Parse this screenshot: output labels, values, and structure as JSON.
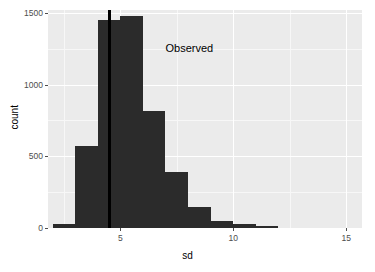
{
  "chart_data": {
    "type": "bar",
    "title": "",
    "subtitle": "",
    "xlabel": "sd",
    "ylabel": "count",
    "xlim": [
      1.8,
      15.7
    ],
    "ylim": [
      0,
      1520
    ],
    "grid": true,
    "legend": "none",
    "bin_width": 1,
    "categories": [
      "2.5",
      "3.5",
      "4.5",
      "5.5",
      "6.5",
      "7.5",
      "8.5",
      "9.5",
      "10.5",
      "11.5"
    ],
    "x": [
      2.5,
      3.5,
      4.5,
      5.5,
      6.5,
      7.5,
      8.5,
      9.5,
      10.5,
      11.5
    ],
    "values": [
      25,
      570,
      1450,
      1475,
      815,
      390,
      150,
      50,
      25,
      5
    ],
    "bar_color": "#2b2b2b",
    "panel_color": "#ebebeb",
    "gridline_color": "#ffffff",
    "xticks": [
      5,
      10,
      15
    ],
    "xtick_labels": [
      "5",
      "10",
      "15"
    ],
    "yticks": [
      0,
      500,
      1000,
      1500
    ],
    "ytick_labels": [
      "0",
      "500",
      "1000",
      "1500"
    ],
    "x_minor_ticks": [
      2.5,
      7.5,
      12.5
    ],
    "y_minor_ticks": [
      250,
      750,
      1250
    ],
    "annotations": [
      {
        "name": "observed-label",
        "text": "Observed",
        "x": 7.0,
        "y": 1290
      }
    ],
    "reference_lines": [
      {
        "name": "observed-vline",
        "orientation": "vertical",
        "x": 4.52,
        "color": "#000000",
        "width_px": 3
      }
    ]
  }
}
